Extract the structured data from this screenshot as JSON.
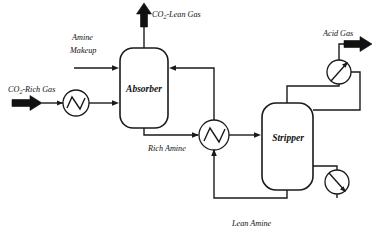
{
  "diagram": {
    "type": "process-flow-diagram",
    "background_color": "#ffffff",
    "line_color": "#1a1a1a"
  },
  "vessels": [
    {
      "id": "absorber",
      "label": "Absorber",
      "shape": "vertical-column",
      "x": 120,
      "y": 48,
      "width": 48,
      "height": 80
    },
    {
      "id": "stripper",
      "label": "Stripper",
      "shape": "vertical-column",
      "x": 262,
      "y": 103,
      "width": 51,
      "height": 87
    }
  ],
  "equipment": [
    {
      "id": "feed-cooler",
      "type": "heat-exchanger",
      "glyph": "zigzag",
      "cx": 76,
      "cy": 103,
      "r": 13
    },
    {
      "id": "cross-exchanger",
      "type": "heat-exchanger",
      "glyph": "zigzag",
      "cx": 214,
      "cy": 135,
      "r": 15
    },
    {
      "id": "overhead-condenser",
      "type": "condenser",
      "glyph": "diagonal-arrow-up",
      "cx": 339,
      "cy": 72,
      "r": 12
    },
    {
      "id": "reboiler",
      "type": "reboiler",
      "glyph": "diagonal-arrow-down",
      "cx": 337,
      "cy": 182,
      "r": 12
    }
  ],
  "streams": [
    {
      "id": "co2-rich-gas",
      "label_line1": "CO",
      "label_sub": "2",
      "label_line2": "-Rich Gas",
      "full_label": "CO2-Rich Gas",
      "terminator": "block-arrow",
      "direction": "into-process"
    },
    {
      "id": "amine-makeup",
      "label_line1": "Amine",
      "label_line2": "Makeup",
      "full_label": "Amine Makeup",
      "terminator": "line-arrow",
      "direction": "into-absorber"
    },
    {
      "id": "co2-lean-gas",
      "label_line1": "CO",
      "label_sub": "2",
      "label_line2": "-Lean Gas",
      "full_label": "CO2-Lean Gas",
      "terminator": "block-arrow",
      "direction": "out-of-absorber-top"
    },
    {
      "id": "rich-amine",
      "full_label": "Rich Amine",
      "direction": "absorber-bottom-to-exchanger"
    },
    {
      "id": "lean-amine",
      "full_label": "Lean Amine",
      "direction": "stripper-bottom-to-exchanger-to-absorber"
    },
    {
      "id": "acid-gas",
      "full_label": "Acid Gas",
      "terminator": "block-arrow",
      "direction": "out-of-condenser"
    }
  ]
}
